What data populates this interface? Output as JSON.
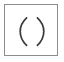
{
  "icon": {
    "name": "parentheses-icon",
    "glyph": "( )",
    "left_paren": "(",
    "right_paren": ")",
    "alt_text": "parentheses in square frame",
    "frame_shape": "square-outline",
    "colors": {
      "background": "#ffffff",
      "frame_border": "#8c8c8c",
      "glyph": "#3a3a3a"
    },
    "geometry": {
      "canvas_width": 64,
      "canvas_height": 62,
      "frame_left": 4,
      "frame_top": 4,
      "frame_width": 54,
      "frame_height": 52,
      "frame_border_width": 1,
      "glyph_top": 17,
      "glyph_bottom": 46,
      "left_paren_x": 20,
      "right_paren_x": 44
    }
  }
}
